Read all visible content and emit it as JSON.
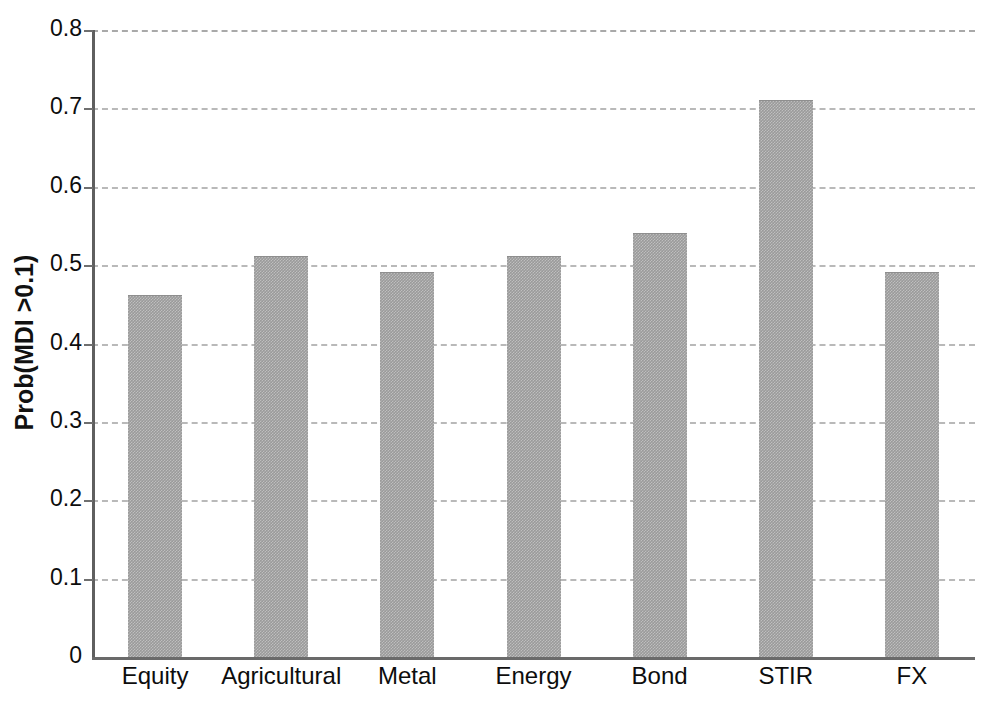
{
  "chart_data": {
    "type": "bar",
    "title": "",
    "xlabel": "",
    "ylabel": "Prob(MDI >0.1)",
    "categories": [
      "Equity",
      "Agricultural",
      "Metal",
      "Energy",
      "Bond",
      "STIR",
      "FX"
    ],
    "values": [
      0.46,
      0.51,
      0.49,
      0.51,
      0.54,
      0.71,
      0.49
    ],
    "ylim": [
      0,
      0.8
    ],
    "ytick_labels": [
      "0",
      "0.1",
      "0.2",
      "0.3",
      "0.4",
      "0.5",
      "0.6",
      "0.7",
      "0.8"
    ],
    "ytick_values": [
      0,
      0.1,
      0.2,
      0.3,
      0.4,
      0.5,
      0.6,
      0.7,
      0.8
    ],
    "grid": true,
    "grid_style": "dashed",
    "legend": null,
    "bar_color": "#9a9a9a",
    "grid_color": "#b9b9b9",
    "axis_color": "#5f5f5f",
    "text_color": "#0d0d0d",
    "background": "#ffffff"
  }
}
